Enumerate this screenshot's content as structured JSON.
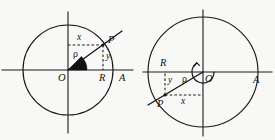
{
  "figure": {
    "background_color": "#f8f8f6",
    "ink_color": "#141414",
    "width": 275,
    "height": 140
  },
  "diagrams": [
    {
      "id": "left",
      "name": "acute-angle-diagram",
      "center": {
        "x": 68,
        "y": 70
      },
      "radius": 45,
      "point": {
        "x": 103,
        "y": 45
      },
      "angle_label": "acute",
      "labels": {
        "origin": "O",
        "point": "P",
        "axis_end": "A",
        "foot": "R",
        "abscissa": "x",
        "ordinate": "y",
        "radius_vector": "ρ"
      }
    },
    {
      "id": "right",
      "name": "reflex-angle-diagram",
      "center": {
        "x": 203,
        "y": 72
      },
      "radius": 55,
      "point": {
        "x": 165,
        "y": 95
      },
      "angle_label": "reflex",
      "labels": {
        "origin": "O",
        "point": "P",
        "axis_end": "A",
        "foot": "R",
        "abscissa": "x",
        "ordinate": "y",
        "radius_vector": "ρ"
      }
    }
  ]
}
